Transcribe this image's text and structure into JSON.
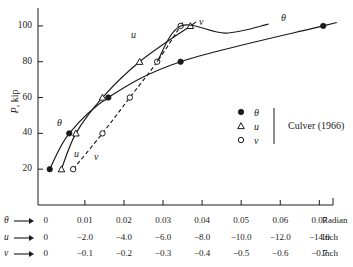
{
  "chart_data": {
    "type": "line",
    "title": "",
    "ylabel": "P, kip",
    "ylim": [
      0,
      110
    ],
    "yticks": [
      20,
      40,
      60,
      80,
      100
    ],
    "grid": false,
    "xlim": [
      -0.002,
      0.0735
    ],
    "axes": [
      {
        "name": "theta",
        "symbol": "θ",
        "unit": "Radian",
        "ticks": [
          "0",
          "0.01",
          "0.02",
          "0.03",
          "0.04",
          "0.05",
          "0.06",
          "0.07"
        ],
        "values": [
          0,
          0.01,
          0.02,
          0.03,
          0.04,
          0.05,
          0.06,
          0.07
        ]
      },
      {
        "name": "u",
        "symbol": "u",
        "unit": "Inch",
        "ticks": [
          "0",
          "−2.0",
          "−4.0",
          "−6.0",
          "−8.0",
          "−10.0",
          "−12.0",
          "−14.0"
        ],
        "values": [
          0,
          -2.0,
          -4.0,
          -6.0,
          -8.0,
          -10.0,
          -12.0,
          -14.0
        ]
      },
      {
        "name": "v",
        "symbol": "v",
        "unit": "Inch",
        "ticks": [
          "0",
          "−0.1",
          "−0.2",
          "−0.3",
          "−0.4",
          "−0.5",
          "−0.6",
          "−0.7"
        ],
        "values": [
          0,
          -0.1,
          -0.2,
          -0.3,
          -0.4,
          -0.5,
          -0.6,
          -0.7
        ]
      }
    ],
    "series": [
      {
        "name": "theta",
        "label": "θ",
        "marker": "filled-circle",
        "line": "solid",
        "x": [
          0.001,
          0.006,
          0.016,
          0.0345,
          0.071
        ],
        "y": [
          20,
          40,
          60,
          80,
          100
        ]
      },
      {
        "name": "u",
        "label": "u",
        "marker": "open-triangle",
        "line": "solid",
        "x": [
          0.004,
          0.0077,
          0.0145,
          0.024,
          0.037
        ],
        "y": [
          20,
          40,
          60,
          80,
          100
        ]
      },
      {
        "name": "v",
        "label": "v",
        "marker": "open-circle",
        "line": "dashed",
        "x": [
          0.007,
          0.0145,
          0.0215,
          0.0285,
          0.0345
        ],
        "y": [
          20,
          40,
          60,
          80,
          100
        ]
      }
    ],
    "curve_labels": [
      {
        "text": "θ",
        "x": 57,
        "y": 118
      },
      {
        "text": "u",
        "x": 74,
        "y": 149
      },
      {
        "text": "v",
        "x": 94,
        "y": 152
      },
      {
        "text": "u",
        "x": 131,
        "y": 30
      },
      {
        "text": "v",
        "x": 199,
        "y": 17
      },
      {
        "text": "θ",
        "x": 281,
        "y": 13
      }
    ],
    "legend": {
      "position": "right-middle",
      "source": "Culver (1966)",
      "entries": [
        {
          "marker": "filled-circle",
          "label": "θ"
        },
        {
          "marker": "open-triangle",
          "label": "u"
        },
        {
          "marker": "open-circle",
          "label": "v"
        }
      ]
    },
    "colors": {
      "ink": "#1a1a1a",
      "background": "#ffffff"
    }
  }
}
